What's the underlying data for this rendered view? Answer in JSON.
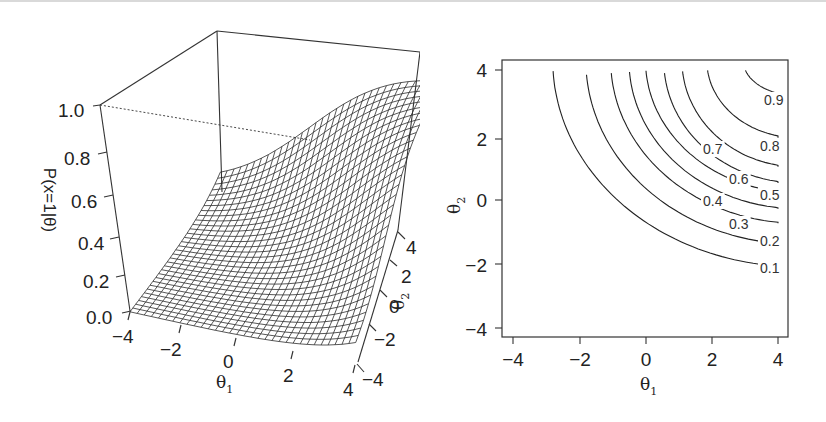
{
  "figure": {
    "left_panel": {
      "zlabel": "P(x=1|θ)",
      "xlabel_base": "θ",
      "xlabel_sub": "1",
      "ylabel_base": "θ",
      "ylabel_sub": "2",
      "z_ticks": [
        "0.0",
        "0.2",
        "0.4",
        "0.6",
        "0.8",
        "1.0"
      ],
      "x_ticks": [
        "−4",
        "−2",
        "0",
        "2",
        "4"
      ],
      "y_ticks": [
        "−4",
        "−2",
        "0",
        "2",
        "4"
      ]
    },
    "right_panel": {
      "xlabel_base": "θ",
      "xlabel_sub": "1",
      "ylabel_base": "θ",
      "ylabel_sub": "2",
      "x_ticks": [
        "−4",
        "−2",
        "0",
        "2",
        "4"
      ],
      "y_ticks": [
        "−4",
        "−2",
        "0",
        "2",
        "4"
      ],
      "contour_labels": [
        "0.1",
        "0.2",
        "0.3",
        "0.4",
        "0.5",
        "0.6",
        "0.7",
        "0.8",
        "0.9"
      ]
    }
  },
  "chart_data": [
    {
      "type": "surface",
      "title": "",
      "xlabel": "θ1",
      "ylabel": "θ2",
      "zlabel": "P(x=1|θ)",
      "xlim": [
        -4,
        4
      ],
      "ylim": [
        -4,
        4
      ],
      "zlim": [
        0,
        1
      ],
      "x_ticks": [
        -4,
        -2,
        0,
        2,
        4
      ],
      "y_ticks": [
        -4,
        -2,
        0,
        2,
        4
      ],
      "z_ticks": [
        0.0,
        0.2,
        0.4,
        0.6,
        0.8,
        1.0
      ],
      "grid_points": 33,
      "description": "Wireframe surface of P(x=1|θ) rising from ~0 at θ1=−4,θ2=−4 to ~0.95 at θ1=4,θ2=4 (compensatory-like 2D IRT response surface)",
      "corner_values": {
        "(-4,-4)": 0.0,
        "(4,-4)": 0.05,
        "(-4,4)": 0.05,
        "(4,4)": 0.95
      }
    },
    {
      "type": "contour",
      "title": "",
      "xlabel": "θ1",
      "ylabel": "θ2",
      "xlim": [
        -4,
        4
      ],
      "ylim": [
        -4,
        4
      ],
      "x_ticks": [
        -4,
        -2,
        0,
        2,
        4
      ],
      "y_ticks": [
        -4,
        -2,
        0,
        2,
        4
      ],
      "levels": [
        0.1,
        0.2,
        0.3,
        0.4,
        0.5,
        0.6,
        0.7,
        0.8,
        0.9
      ],
      "contours": [
        {
          "level": 0.1,
          "top_intercept_theta1": -2.8,
          "right_intercept_theta2": -2.1
        },
        {
          "level": 0.2,
          "top_intercept_theta1": -1.8,
          "right_intercept_theta2": -1.4
        },
        {
          "level": 0.3,
          "top_intercept_theta1": -1.05,
          "right_intercept_theta2": -0.75
        },
        {
          "level": 0.4,
          "top_intercept_theta1": -0.5,
          "right_intercept_theta2": -0.3
        },
        {
          "level": 0.5,
          "top_intercept_theta1": 0.0,
          "right_intercept_theta2": 0.2
        },
        {
          "level": 0.6,
          "top_intercept_theta1": 0.55,
          "right_intercept_theta2": 0.5
        },
        {
          "level": 0.7,
          "top_intercept_theta1": 1.1,
          "right_intercept_theta2": 1.0
        },
        {
          "level": 0.8,
          "top_intercept_theta1": 1.85,
          "right_intercept_theta2": 1.9
        },
        {
          "level": 0.9,
          "top_intercept_theta1": 2.95,
          "right_intercept_theta2": 3.2
        }
      ]
    }
  ]
}
